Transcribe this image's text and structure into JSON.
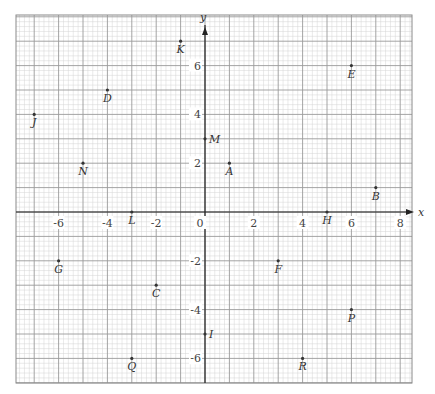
{
  "chart_data": {
    "type": "scatter",
    "title": "",
    "xlabel": "x",
    "ylabel": "y",
    "xlim": [
      -7.75,
      8.5
    ],
    "ylim": [
      -7,
      8.1
    ],
    "grid": true,
    "grid_minor_step": 0.2,
    "grid_major_step": 1,
    "x_ticks": [
      -6,
      -4,
      -2,
      0,
      2,
      4,
      6,
      8
    ],
    "y_ticks": [
      -6,
      -4,
      -2,
      2,
      4,
      6
    ],
    "x_tick_labels": [
      "-6",
      "-4",
      "-2",
      "0",
      "2",
      "4",
      "6",
      "8"
    ],
    "y_tick_labels": [
      "-6",
      "-4",
      "-2",
      "2",
      "4",
      "6"
    ],
    "points": [
      {
        "label": "A",
        "x": 1,
        "y": 2
      },
      {
        "label": "B",
        "x": 7,
        "y": 1
      },
      {
        "label": "C",
        "x": -2,
        "y": -3
      },
      {
        "label": "D",
        "x": -4,
        "y": 5
      },
      {
        "label": "E",
        "x": 6,
        "y": 6
      },
      {
        "label": "F",
        "x": 3,
        "y": -2
      },
      {
        "label": "G",
        "x": -6,
        "y": -2
      },
      {
        "label": "H",
        "x": 5,
        "y": 0
      },
      {
        "label": "I",
        "x": 0,
        "y": -5
      },
      {
        "label": "J",
        "x": -7,
        "y": 4
      },
      {
        "label": "K",
        "x": -1,
        "y": 7
      },
      {
        "label": "L",
        "x": -3,
        "y": 0
      },
      {
        "label": "M",
        "x": 0,
        "y": 3
      },
      {
        "label": "N",
        "x": -5,
        "y": 2
      },
      {
        "label": "P",
        "x": 6,
        "y": -4
      },
      {
        "label": "Q",
        "x": -3,
        "y": -6
      },
      {
        "label": "R",
        "x": 4,
        "y": -6
      }
    ]
  },
  "layout": {
    "origin_px": [
      205,
      212
    ],
    "unit_px": 24.4,
    "plot_left": 16,
    "plot_right": 412,
    "plot_top": 15,
    "plot_bottom": 383,
    "colors": {
      "minor_grid": "#d4d4d4",
      "major_grid": "#9a9a9a",
      "axis": "#222222",
      "point": "#333333"
    }
  }
}
